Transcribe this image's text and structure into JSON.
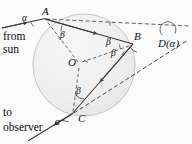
{
  "figure": {
    "name": "rainbow-ray-geometry",
    "background_color": "#fbfbfb",
    "stroke_color": "#3a3a3a",
    "sphere_fill": "#f0f0f0",
    "sphere_stroke": "#b9b9b9"
  },
  "points": {
    "a": {
      "label": "A",
      "x": 45,
      "y": 18
    },
    "b": {
      "label": "B",
      "x": 133,
      "y": 44
    },
    "c": {
      "label": "C",
      "x": 72,
      "y": 114
    },
    "o": {
      "label": "O",
      "x": 73,
      "y": 62
    }
  },
  "angles": {
    "alpha_incident": {
      "label": "α",
      "x": 24,
      "y": 19
    },
    "alpha_exit": {
      "label": "α",
      "x": 57,
      "y": 123
    },
    "beta_a": {
      "label": "β",
      "x": 63,
      "y": 36
    },
    "beta_b_upper": {
      "label": "β",
      "x": 109,
      "y": 44
    },
    "beta_b_lower": {
      "label": "β",
      "x": 110,
      "y": 57
    },
    "beta_c": {
      "label": "β",
      "x": 77,
      "y": 93
    }
  },
  "deviation": {
    "label": "D(α)",
    "x": 160,
    "y": 41
  },
  "captions": {
    "from_sun": {
      "line1": "from",
      "line2": "sun",
      "x": 3,
      "y": 32
    },
    "to_observer": {
      "line1": "to",
      "line2": "observer",
      "x": 3,
      "y": 108
    }
  },
  "geometry": {
    "circle": {
      "cx": 84,
      "cy": 65,
      "r": 51
    },
    "incident_ray": {
      "x1": 2,
      "y1": 28,
      "x2": 45,
      "y2": 18
    },
    "chord_ab": {
      "x1": 45,
      "y1": 18,
      "x2": 133,
      "y2": 44
    },
    "chord_bc": {
      "x1": 133,
      "y1": 44,
      "x2": 72,
      "y2": 114
    },
    "exit_ray": {
      "x1": 72,
      "y1": 114,
      "x2": 30,
      "y2": 140
    },
    "radius_oa": {
      "x1": 73,
      "y1": 62,
      "x2": 45,
      "y2": 18
    },
    "radius_ob": {
      "x1": 73,
      "y1": 62,
      "x2": 133,
      "y2": 44
    },
    "radius_oc": {
      "x1": 73,
      "y1": 62,
      "x2": 72,
      "y2": 114
    },
    "horizontal_dashed": {
      "x1": 2,
      "y1": 28,
      "x2": 190,
      "y2": 33
    },
    "extended_dashed": {
      "x1": 45,
      "y1": 18,
      "x2": 190,
      "y2": 60
    },
    "deviation_dashed": {
      "x1": 72,
      "y1": 114,
      "x2": 190,
      "y2": 44
    }
  },
  "meta": {
    "type": "geometric-optics-diagram"
  }
}
